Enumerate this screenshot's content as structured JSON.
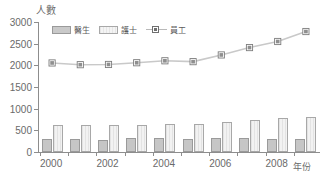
{
  "chart_data": {
    "type": "bar",
    "title": "",
    "xlabel": "年份",
    "ylabel": "人數",
    "ylim": [
      0,
      3000
    ],
    "ytick_step": 500,
    "yticks": [
      0,
      500,
      1000,
      1500,
      2000,
      2500,
      3000
    ],
    "grid": false,
    "legend_position": "top-left",
    "categories": [
      2000,
      2001,
      2002,
      2003,
      2004,
      2005,
      2006,
      2007,
      2008,
      2009
    ],
    "xtick_labels": [
      "2000",
      "",
      "2002",
      "",
      "2004",
      "",
      "2006",
      "",
      "2008",
      ""
    ],
    "series": [
      {
        "name": "醫生",
        "render": "bar",
        "color": "#c6c6c6",
        "values": [
          310,
          305,
          285,
          325,
          320,
          300,
          320,
          315,
          310,
          300
        ]
      },
      {
        "name": "護士",
        "render": "bar",
        "color": "#eeeeee",
        "values": [
          625,
          625,
          625,
          625,
          650,
          650,
          690,
          730,
          775,
          800
        ]
      },
      {
        "name": "員工",
        "render": "line",
        "color": "#6f6f6f",
        "values": [
          2055,
          2015,
          2020,
          2060,
          2105,
          2085,
          2240,
          2410,
          2550,
          2780
        ]
      }
    ]
  },
  "legend": {
    "items": [
      {
        "label": "醫生",
        "swatch": "bar-dark-swatch"
      },
      {
        "label": "護士",
        "swatch": "bar-light-swatch"
      },
      {
        "label": "員工",
        "swatch": "line-marker-swatch"
      }
    ]
  },
  "axes": {
    "y_title": "人數",
    "x_title": "年份"
  }
}
